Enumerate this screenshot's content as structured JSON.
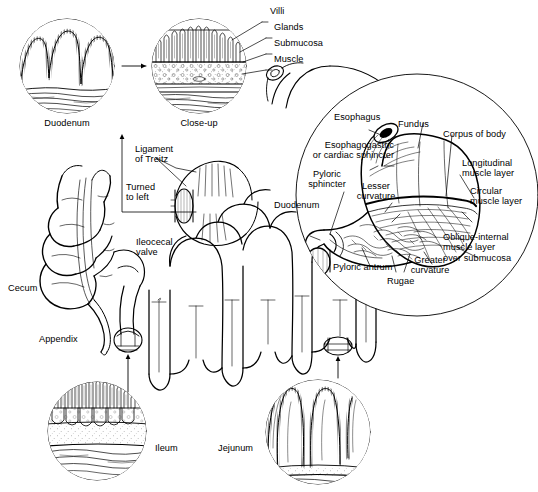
{
  "figure": {
    "type": "anatomical-line-diagram",
    "background_color": "#ffffff",
    "ink_color": "#000000",
    "width": 538,
    "height": 492
  },
  "labels": {
    "duodenum_circle": "Duodenum",
    "closeup_circle": "Close-up",
    "villi": "Villi",
    "glands": "Glands",
    "submucosa": "Submucosa",
    "muscle": "Muscle",
    "ligament_of_treitz": "Ligament\nof Treitz",
    "turned_to_left": "Turned\nto left",
    "ileocecal_valve": "Ileocecal\nvalve",
    "cecum": "Cecum",
    "appendix": "Appendix",
    "ileum": "Ileum",
    "jejunum": "Jejunum",
    "esophagus": "Esophagus",
    "fundus": "Fundus",
    "corpus_of_body": "Corpus of body",
    "esophagogastric_sphincter": "Esophagogastric\nor cardiac sphincter",
    "longitudinal_muscle_layer": "Longitudinal\nmuscle layer",
    "pyloric_sphincter": "Pyloric\nsphincter",
    "lesser_curvature": "Lesser\ncurvature",
    "circular_muscle_layer": "Circular\nmuscle layer",
    "duodenum_inset": "Duodenum",
    "oblique_internal_muscle_layer": "Oblique-internal\nmuscle layer\nover submucosa",
    "pyloric_antrum": "Pyloric antrum",
    "rugae": "Rugae",
    "greater_curvature": "Greater\ncurvature"
  },
  "insets": [
    {
      "name": "duodenum-wall-inset",
      "label": "Duodenum",
      "cx": 67,
      "cy": 66,
      "r": 48
    },
    {
      "name": "closeup-wall-inset",
      "label": "Close-up",
      "cx": 199,
      "cy": 66,
      "r": 48
    },
    {
      "name": "ileum-wall-inset",
      "label": "Ileum",
      "cx": 97,
      "cy": 431,
      "r": 50
    },
    {
      "name": "jejunum-wall-inset",
      "label": "Jejunum",
      "cx": 318,
      "cy": 432,
      "r": 53
    },
    {
      "name": "stomach-magnifier-inset",
      "label": "Stomach",
      "cx": 417,
      "cy": 195,
      "r": 122
    }
  ]
}
